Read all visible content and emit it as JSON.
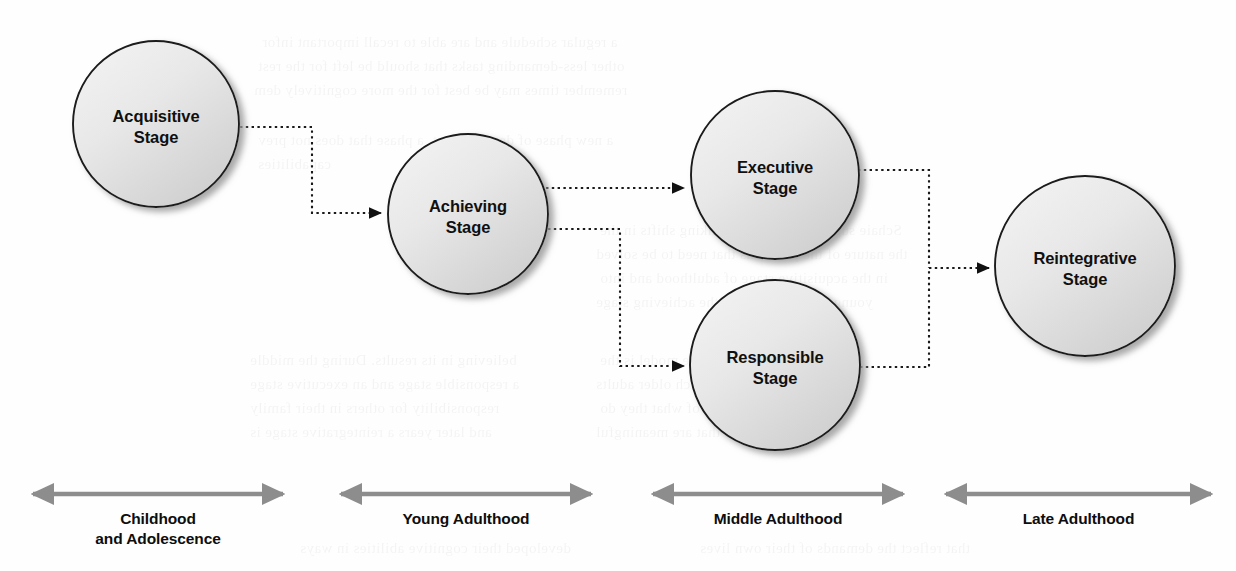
{
  "diagram": {
    "node_fill_light": "#f0f0f0",
    "node_fill_dark": "#cfcfcf",
    "node_stroke": "#1a1a1a",
    "connector_color": "#1a1a1a",
    "timeline_arrow_color": "#8d8d8d",
    "nodes": [
      {
        "id": "acquisitive",
        "label_line1": "Acquisitive",
        "label_line2": "Stage",
        "cx": 156,
        "cy": 124,
        "r": 83
      },
      {
        "id": "achieving",
        "label_line1": "Achieving",
        "label_line2": "Stage",
        "cx": 468,
        "cy": 214,
        "r": 80
      },
      {
        "id": "executive",
        "label_line1": "Executive",
        "label_line2": "Stage",
        "cx": 775,
        "cy": 175,
        "r": 84
      },
      {
        "id": "responsible",
        "label_line1": "Responsible",
        "label_line2": "Stage",
        "cx": 775,
        "cy": 365,
        "r": 85
      },
      {
        "id": "reintegrative",
        "label_line1": "Reintegrative",
        "label_line2": "Stage",
        "cx": 1085,
        "cy": 266,
        "r": 90
      }
    ],
    "connectors": [
      {
        "id": "acquisitive-to-achieving",
        "from": "acquisitive",
        "to": "achieving",
        "path": "M 240 127 L 312 127 L 312 213 L 381 213"
      },
      {
        "id": "achieving-to-executive",
        "from": "achieving",
        "to": "executive",
        "path": "M 546 188 L 684 188"
      },
      {
        "id": "achieving-to-responsible",
        "from": "achieving",
        "to": "responsible",
        "path": "M 548 229 L 620 229 L 620 366 L 684 366"
      },
      {
        "id": "executive-to-reintegrative",
        "from": "executive",
        "to": "reintegrative",
        "path": "M 858 170 L 929 170 L 929 268"
      },
      {
        "id": "responsible-to-reintegrative",
        "from": "responsible",
        "to": "reintegrative",
        "path": "M 860 367 L 929 367 L 929 268"
      },
      {
        "id": "merge-to-reintegrative",
        "from": "merge",
        "to": "reintegrative",
        "path": "M 929 268 L 989 268"
      }
    ],
    "timeline": [
      {
        "id": "childhood",
        "label_line1": "Childhood",
        "label_line2": "and Adolescence",
        "x1": 33,
        "x2": 283,
        "y": 494
      },
      {
        "id": "young-adulthood",
        "label_line1": "Young Adulthood",
        "label_line2": "",
        "x1": 341,
        "x2": 591,
        "y": 494
      },
      {
        "id": "middle-adulthood",
        "label_line1": "Middle Adulthood",
        "label_line2": "",
        "x1": 653,
        "x2": 903,
        "y": 494
      },
      {
        "id": "late-adulthood",
        "label_line1": "Late Adulthood",
        "label_line2": "",
        "x1": 946,
        "x2": 1211,
        "y": 494
      }
    ],
    "ghost_text": [
      {
        "text": "a regular schedule and are able to recall important infor",
        "x": 262,
        "y": 34
      },
      {
        "text": "other less-demanding tasks that should be left for the rest",
        "x": 258,
        "y": 58
      },
      {
        "text": "remember times may be best for the more cognitively dem",
        "x": 254,
        "y": 82
      },
      {
        "text": "a new phase of development, a phase that does not prev",
        "x": 258,
        "y": 132
      },
      {
        "text": "capabilities",
        "x": 258,
        "y": 156
      },
      {
        "text": "Schaie suggests that adult thinking shifts in the",
        "x": 600,
        "y": 222
      },
      {
        "text": "the nature of the problems that need to be solved",
        "x": 596,
        "y": 246
      },
      {
        "text": "in the acquisitive stage of adulthood and into",
        "x": 600,
        "y": 270
      },
      {
        "text": "young adults move into the achieving stage",
        "x": 596,
        "y": 294
      },
      {
        "text": "believing in its results. During the middle",
        "x": 250,
        "y": 352
      },
      {
        "text": "a responsible stage and an executive stage",
        "x": 250,
        "y": 376
      },
      {
        "text": "responsibility for others in their family",
        "x": 250,
        "y": 400
      },
      {
        "text": "and later years a reintegrative stage is",
        "x": 250,
        "y": 424
      },
      {
        "text": "The final stage of the model is the",
        "x": 600,
        "y": 352
      },
      {
        "text": "reintegrative stage in which older adults",
        "x": 596,
        "y": 376
      },
      {
        "text": "focus on the purpose of what they do",
        "x": 600,
        "y": 400
      },
      {
        "text": "and select tasks that are meaningful",
        "x": 596,
        "y": 424
      },
      {
        "text": "developed their cognitive abilities in ways",
        "x": 300,
        "y": 540
      },
      {
        "text": "that reflect the demands of their own lives",
        "x": 700,
        "y": 540
      }
    ]
  }
}
